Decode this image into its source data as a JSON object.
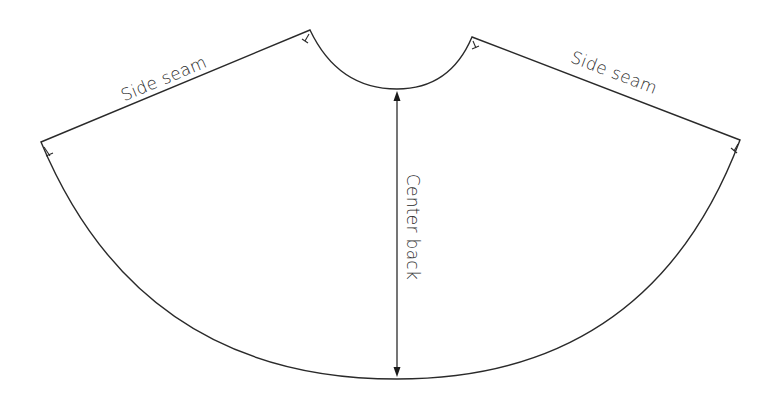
{
  "diagram": {
    "type": "sewing-pattern",
    "labels": {
      "left_side_seam": "Side seam",
      "right_side_seam": "Side seam",
      "center_back": "Center back"
    },
    "colors": {
      "background": "#ffffff",
      "line": "#2a2a2a"
    },
    "elements": [
      {
        "id": "waist-curve",
        "kind": "curve"
      },
      {
        "id": "left-side-seam",
        "kind": "line",
        "label": "Side seam"
      },
      {
        "id": "right-side-seam",
        "kind": "line",
        "label": "Side seam"
      },
      {
        "id": "hem-curve",
        "kind": "curve"
      },
      {
        "id": "center-back-arrow",
        "kind": "double-arrow",
        "label": "Center back"
      },
      {
        "id": "notch-marks",
        "kind": "marker",
        "count": 4
      }
    ]
  }
}
